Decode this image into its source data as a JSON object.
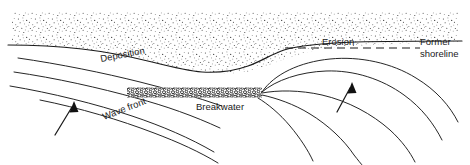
{
  "figure": {
    "type": "coastal-geomorphology-cross-section",
    "width": 470,
    "height": 165,
    "background_color": "#ffffff",
    "line_color": "#1a1a1a",
    "stipple_color": "#3a3a3a"
  },
  "labels": {
    "deposition": "Deposition",
    "erosion": "Erosion",
    "former_shoreline_line1": "Former",
    "former_shoreline_line2": "shoreline",
    "breakwater": "Breakwater",
    "wave_front": "Wave front"
  },
  "elements": {
    "land_region": "stippled land / beach area across top of figure",
    "shoreline_curve": "solid curved line, salient bulge behind breakwater then erosion embayment to the right",
    "former_shoreline_dashes": "horizontal dashed line marking the original shoreline position",
    "breakwater_structure": "rubble mound of small circles, offshore and parallel to coast",
    "wave_front_lines": "parallel oblique crest lines approaching from lower left",
    "diffracted_wave_lines": "arcs bending around the breakwater tip into the sheltered lee",
    "direction_arrow_left": "arrow showing wave approach direction, lower left",
    "direction_arrow_right": "arrow showing wave approach direction, right side"
  },
  "caption_stub": ""
}
